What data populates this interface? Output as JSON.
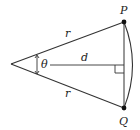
{
  "diagram": {
    "type": "circular-sector-chord",
    "labels": {
      "point_top": "P",
      "point_bottom": "Q",
      "radius_top": "r",
      "radius_bottom": "r",
      "distance": "d",
      "angle": "θ"
    },
    "elements": [
      "two radii of length r from apex to P and Q",
      "circular arc from P to Q",
      "chord PQ",
      "segment d from angle marker to chord, perpendicular to chord",
      "right-angle marker at foot of d",
      "double-headed angle arrow labeled θ"
    ],
    "colors": {
      "line": "#333333",
      "point": "#111111",
      "background": "#ffffff"
    }
  }
}
